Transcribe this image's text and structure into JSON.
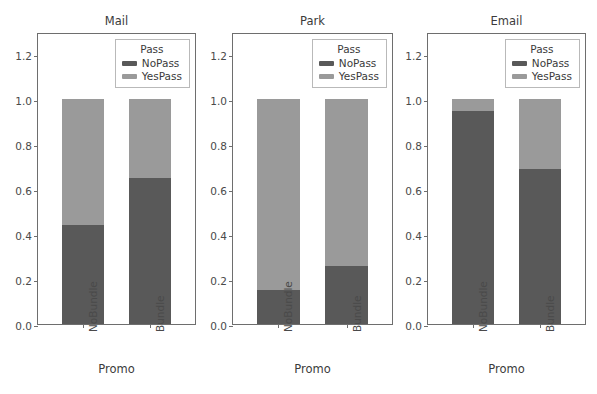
{
  "figure": {
    "width": 597,
    "height": 394,
    "background": "#ffffff",
    "kind": "faceted-stacked-bar-chart"
  },
  "axis": {
    "xlabel": "Promo",
    "ylabel": "",
    "ytick_labels": [
      "0.0",
      "0.2",
      "0.4",
      "0.6",
      "0.8",
      "1.0",
      "1.2"
    ],
    "ytick_values": [
      0.0,
      0.2,
      0.4,
      0.6,
      0.8,
      1.0,
      1.2
    ],
    "xtick_labels": [
      "NoBundle",
      "Bundle"
    ],
    "ylim": [
      0,
      1.3
    ],
    "grid": "off"
  },
  "legend": {
    "title": "Pass",
    "position": "upper right",
    "entries": [
      {
        "label": "NoPass",
        "color": "#595959"
      },
      {
        "label": "YesPass",
        "color": "#9a9a9a"
      }
    ]
  },
  "colors": {
    "nopass": "#595959",
    "yespass": "#9a9a9a",
    "frame": "#6e6e6e",
    "text": "#3b3b3b",
    "tick_text": "#4a4a4a"
  },
  "panels": [
    {
      "title": "Mail",
      "left": 37,
      "width": 159
    },
    {
      "title": "Park",
      "left": 232,
      "width": 161
    },
    {
      "title": "Email",
      "left": 427,
      "width": 159
    }
  ],
  "chart_data": {
    "type": "bar",
    "subtype": "stacked-100-percent",
    "title": "",
    "xlabel": "Promo",
    "ylabel": "",
    "ylim": [
      0,
      1.3
    ],
    "yticks": [
      0.0,
      0.2,
      0.4,
      0.6,
      0.8,
      1.0,
      1.2
    ],
    "grid": false,
    "legend_title": "Pass",
    "legend_position": "upper right",
    "facet_variable": "Channel",
    "facets": [
      "Mail",
      "Park",
      "Email"
    ],
    "categories": [
      "NoBundle",
      "Bundle"
    ],
    "series": [
      {
        "name": "NoPass",
        "color": "#595959",
        "values_by_facet": {
          "Mail": [
            0.44,
            0.65
          ],
          "Park": [
            0.15,
            0.26
          ],
          "Email": [
            0.95,
            0.69
          ]
        }
      },
      {
        "name": "YesPass",
        "color": "#9a9a9a",
        "values_by_facet": {
          "Mail": [
            0.56,
            0.35
          ],
          "Park": [
            0.85,
            0.74
          ],
          "Email": [
            0.05,
            0.31
          ]
        }
      }
    ],
    "totals_by_facet": {
      "Mail": [
        1.0,
        1.0
      ],
      "Park": [
        1.0,
        1.0
      ],
      "Email": [
        1.0,
        1.0
      ]
    }
  }
}
